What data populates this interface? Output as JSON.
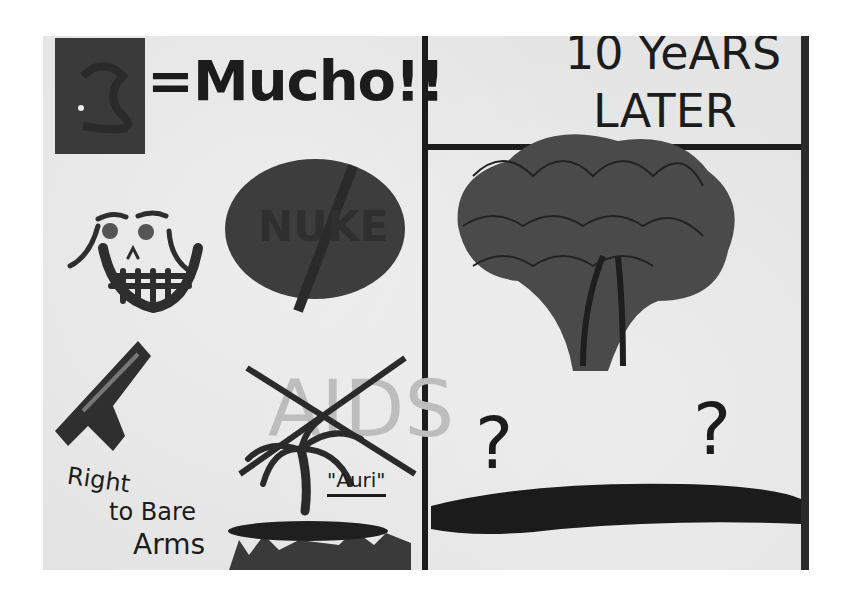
{
  "artwork": {
    "description": "Photograph of a hand-painted poster divided into two panels",
    "palette": {
      "paper": "#e4e4e4",
      "ink": "#1c1c1c",
      "dark_fill": "#3c3c3c",
      "faded": "#bdbdbd"
    },
    "left_panel": {
      "money_equation": {
        "symbol": "$",
        "text": "=Mucho!!"
      },
      "skull": {
        "label": ""
      },
      "nuke_sign": {
        "text": "NUKE",
        "crossed_out": true
      },
      "aids_sign": {
        "text": "AIDS",
        "crossed_out": true
      },
      "gun_caption": {
        "lines": [
          "Right",
          "to Bare",
          "Arms"
        ]
      },
      "palm_tree_caption": {
        "text": "\"Auri\""
      }
    },
    "right_panel": {
      "title_lines": [
        "10 YeARS",
        "LATER"
      ],
      "scene": "mushroom cloud scribble over dark ground",
      "question_marks": [
        "?",
        "?"
      ]
    }
  }
}
